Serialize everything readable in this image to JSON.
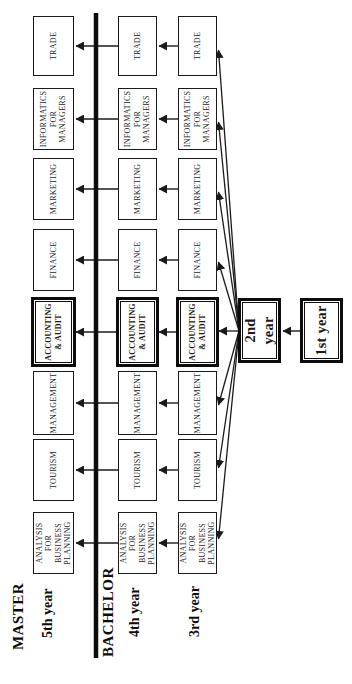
{
  "diagram": {
    "kind": "curriculum-flowchart",
    "background_color": "#ffffff",
    "line_color": "#1a1a1a",
    "box_fill": "#ffffff",
    "sections": [
      {
        "label": "MASTER",
        "years": [
          {
            "label": "5th year"
          }
        ]
      },
      {
        "label": "BACHELOR",
        "years": [
          {
            "label": "4th year"
          },
          {
            "label": "3rd year"
          }
        ]
      }
    ],
    "specializations": [
      {
        "label": "ANALYSIS FOR BUSINESS PLANNING",
        "highlighted": false
      },
      {
        "label": "TOURISM",
        "highlighted": false
      },
      {
        "label": "MANAGEMENT",
        "highlighted": false
      },
      {
        "label": "ACCOUNTING & AUDIT",
        "highlighted": true
      },
      {
        "label": "FINANCE",
        "highlighted": false
      },
      {
        "label": "MARKETING",
        "highlighted": false
      },
      {
        "label": "INFORMATICS FOR MANAGERS",
        "highlighted": false
      },
      {
        "label": "TRADE",
        "highlighted": false
      }
    ],
    "entry": {
      "first_year": "1st year",
      "second_year": "2nd year"
    },
    "flows": [
      "1st year -> 2nd year",
      "2nd year -> every 3rd year specialization (fan of 8 arrows)",
      "3rd year specialization -> 4th year same specialization",
      "4th year specialization -> 5th year same specialization (crosses BACHELOR/MASTER divider line)"
    ]
  }
}
